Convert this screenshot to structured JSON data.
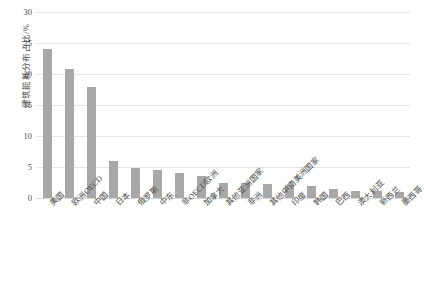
{
  "chart_data": {
    "type": "bar",
    "title": "",
    "subtitle": "",
    "xlabel": "",
    "ylabel": "建筑能耗分布占比/%",
    "ylim": [
      0,
      30
    ],
    "yticks": [
      0,
      5,
      10,
      15,
      20,
      25,
      30
    ],
    "grid": true,
    "legend": "none",
    "bar_color": "#a8a8a8",
    "categories": [
      "美国",
      "欧洲OECD",
      "中国",
      "日本",
      "俄罗斯",
      "中东",
      "非OECD欧洲",
      "加拿大",
      "其他亚洲国家",
      "非洲",
      "其他中南美洲国家",
      "印度",
      "韩国",
      "巴西",
      "澳大利亚",
      "新西兰",
      "墨西哥"
    ],
    "values": [
      24.0,
      20.8,
      17.9,
      6.0,
      4.8,
      4.5,
      4.1,
      3.5,
      2.5,
      2.4,
      2.3,
      2.1,
      1.9,
      1.4,
      1.2,
      1.1,
      1.0
    ]
  }
}
